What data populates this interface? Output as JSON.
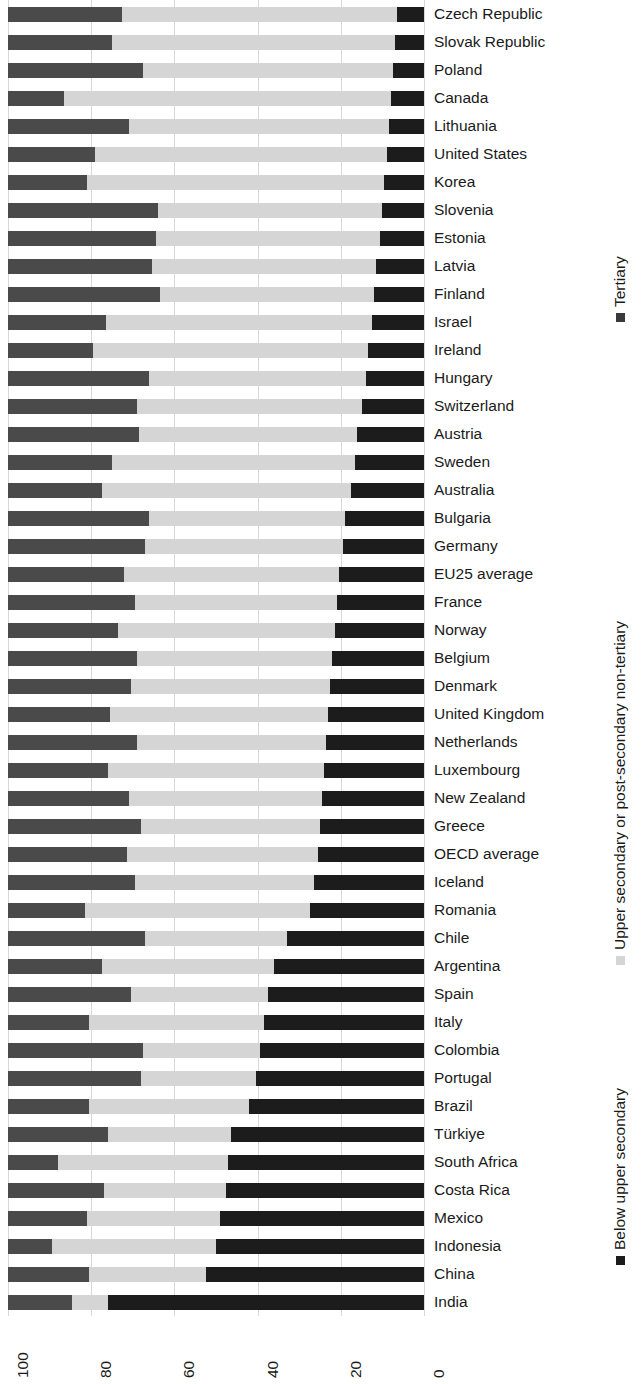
{
  "chart_data": {
    "type": "bar",
    "subtype": "stacked-horizontal-100-percent",
    "title": "",
    "xlabel": "",
    "ylabel": "",
    "xlim": [
      100,
      0
    ],
    "x_axis_reversed": true,
    "xticks": [
      "100",
      "80",
      "60",
      "40",
      "20",
      "0"
    ],
    "xtick_values": [
      100,
      80,
      60,
      40,
      20,
      0
    ],
    "grid": true,
    "grid_axis": "x",
    "legend_position": "right",
    "legend_orientation": "vertical-rotated",
    "colors": {
      "below_upper_secondary": "#4a4a4a",
      "upper_secondary_or_post_secondary_non_tertiary": "#d5d5d5",
      "tertiary": "#1c1c1c",
      "gridline": "#d8d8d8",
      "background": "#ffffff",
      "text": "#1a1a1a"
    },
    "legend": [
      {
        "label": "Below upper secondary",
        "color": "#1c1c1c",
        "key": "below"
      },
      {
        "label": "Upper secondary or post-secondary non-tertiary",
        "color": "#d5d5d5",
        "key": "upper"
      },
      {
        "label": "Tertiary",
        "color": "#3a3a3a",
        "key": "tert"
      }
    ],
    "series": [
      {
        "name": "Below upper secondary",
        "key": "below"
      },
      {
        "name": "Upper secondary or post-secondary non-tertiary",
        "key": "upper"
      },
      {
        "name": "Tertiary",
        "key": "tert"
      }
    ],
    "categories": [
      "Czech Republic",
      "Slovak Republic",
      "Poland",
      "Canada",
      "Lithuania",
      "United States",
      "Korea",
      "Slovenia",
      "Estonia",
      "Latvia",
      "Finland",
      "Israel",
      "Ireland",
      "Hungary",
      "Switzerland",
      "Austria",
      "Sweden",
      "Australia",
      "Bulgaria",
      "Germany",
      "EU25 average",
      "France",
      "Norway",
      "Belgium",
      "Denmark",
      "United Kingdom",
      "Netherlands",
      "Luxembourg",
      "New Zealand",
      "Greece",
      "OECD average",
      "Iceland",
      "Romania",
      "Chile",
      "Argentina",
      "Spain",
      "Italy",
      "Colombia",
      "Portugal",
      "Brazil",
      "Türkiye",
      "South Africa",
      "Costa Rica",
      "Mexico",
      "Indonesia",
      "China",
      "India"
    ],
    "rows": [
      {
        "country": "Czech Republic",
        "below": 27.5,
        "upper": 66.0,
        "tertiary": 6.5
      },
      {
        "country": "Slovak Republic",
        "below": 25.0,
        "upper": 68.0,
        "tertiary": 7.0
      },
      {
        "country": "Poland",
        "below": 32.5,
        "upper": 60.0,
        "tertiary": 7.5
      },
      {
        "country": "Canada",
        "below": 13.5,
        "upper": 78.5,
        "tertiary": 8.0
      },
      {
        "country": "Lithuania",
        "below": 29.0,
        "upper": 62.5,
        "tertiary": 8.5
      },
      {
        "country": "United States",
        "below": 21.0,
        "upper": 70.0,
        "tertiary": 9.0
      },
      {
        "country": "Korea",
        "below": 19.0,
        "upper": 71.5,
        "tertiary": 9.5
      },
      {
        "country": "Slovenia",
        "below": 36.0,
        "upper": 54.0,
        "tertiary": 10.0
      },
      {
        "country": "Estonia",
        "below": 35.5,
        "upper": 54.0,
        "tertiary": 10.5
      },
      {
        "country": "Latvia",
        "below": 34.5,
        "upper": 54.0,
        "tertiary": 11.5
      },
      {
        "country": "Finland",
        "below": 36.5,
        "upper": 51.5,
        "tertiary": 12.0
      },
      {
        "country": "Israel",
        "below": 23.5,
        "upper": 64.0,
        "tertiary": 12.5
      },
      {
        "country": "Ireland",
        "below": 20.5,
        "upper": 66.0,
        "tertiary": 13.5
      },
      {
        "country": "Hungary",
        "below": 34.0,
        "upper": 52.0,
        "tertiary": 14.0
      },
      {
        "country": "Switzerland",
        "below": 31.0,
        "upper": 54.0,
        "tertiary": 15.0
      },
      {
        "country": "Austria",
        "below": 31.5,
        "upper": 52.5,
        "tertiary": 16.0
      },
      {
        "country": "Sweden",
        "below": 25.0,
        "upper": 58.5,
        "tertiary": 16.5
      },
      {
        "country": "Australia",
        "below": 22.5,
        "upper": 60.0,
        "tertiary": 17.5
      },
      {
        "country": "Bulgaria",
        "below": 34.0,
        "upper": 47.0,
        "tertiary": 19.0
      },
      {
        "country": "Germany",
        "below": 33.0,
        "upper": 47.5,
        "tertiary": 19.5
      },
      {
        "country": "EU25 average",
        "below": 28.0,
        "upper": 51.5,
        "tertiary": 20.5
      },
      {
        "country": "France",
        "below": 30.5,
        "upper": 48.5,
        "tertiary": 21.0
      },
      {
        "country": "Norway",
        "below": 26.5,
        "upper": 52.0,
        "tertiary": 21.5
      },
      {
        "country": "Belgium",
        "below": 31.0,
        "upper": 47.0,
        "tertiary": 22.0
      },
      {
        "country": "Denmark",
        "below": 29.5,
        "upper": 48.0,
        "tertiary": 22.5
      },
      {
        "country": "United Kingdom",
        "below": 24.5,
        "upper": 52.5,
        "tertiary": 23.0
      },
      {
        "country": "Netherlands",
        "below": 31.0,
        "upper": 45.5,
        "tertiary": 23.5
      },
      {
        "country": "Luxembourg",
        "below": 24.0,
        "upper": 52.0,
        "tertiary": 24.0
      },
      {
        "country": "New Zealand",
        "below": 29.0,
        "upper": 46.5,
        "tertiary": 24.5
      },
      {
        "country": "Greece",
        "below": 32.0,
        "upper": 43.0,
        "tertiary": 25.0
      },
      {
        "country": "OECD average",
        "below": 28.5,
        "upper": 46.0,
        "tertiary": 25.5
      },
      {
        "country": "Iceland",
        "below": 30.5,
        "upper": 43.0,
        "tertiary": 26.5
      },
      {
        "country": "Romania",
        "below": 18.5,
        "upper": 54.0,
        "tertiary": 27.5
      },
      {
        "country": "Chile",
        "below": 33.0,
        "upper": 34.0,
        "tertiary": 33.0
      },
      {
        "country": "Argentina",
        "below": 22.5,
        "upper": 41.5,
        "tertiary": 36.0
      },
      {
        "country": "Spain",
        "below": 29.5,
        "upper": 33.0,
        "tertiary": 37.5
      },
      {
        "country": "Italy",
        "below": 19.5,
        "upper": 42.0,
        "tertiary": 38.5
      },
      {
        "country": "Colombia",
        "below": 32.5,
        "upper": 28.0,
        "tertiary": 39.5
      },
      {
        "country": "Portugal",
        "below": 32.0,
        "upper": 27.5,
        "tertiary": 40.5
      },
      {
        "country": "Brazil",
        "below": 19.5,
        "upper": 38.5,
        "tertiary": 42.0
      },
      {
        "country": "Türkiye",
        "below": 24.0,
        "upper": 29.5,
        "tertiary": 46.5
      },
      {
        "country": "South Africa",
        "below": 12.0,
        "upper": 41.0,
        "tertiary": 47.0
      },
      {
        "country": "Costa Rica",
        "below": 23.0,
        "upper": 29.5,
        "tertiary": 47.5
      },
      {
        "country": "Mexico",
        "below": 19.0,
        "upper": 32.0,
        "tertiary": 49.0
      },
      {
        "country": "Indonesia",
        "below": 10.5,
        "upper": 39.5,
        "tertiary": 50.0
      },
      {
        "country": "China",
        "below": 19.5,
        "upper": 28.0,
        "tertiary": 52.5
      },
      {
        "country": "India",
        "below": 15.5,
        "upper": 8.5,
        "tertiary": 76.0
      }
    ]
  }
}
